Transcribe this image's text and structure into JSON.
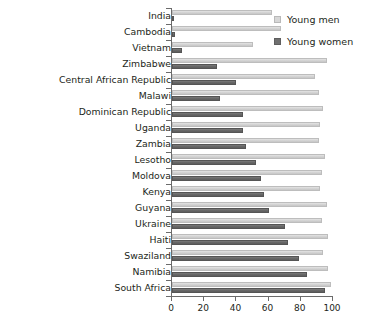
{
  "chart_data": {
    "type": "bar",
    "orientation": "horizontal",
    "title": "",
    "subtitle": "",
    "xlabel": "",
    "ylabel": "",
    "xlim": [
      0,
      100
    ],
    "xticks": [
      0,
      20,
      40,
      60,
      80,
      100
    ],
    "grid": false,
    "legend_position": "top-right",
    "categories": [
      "India",
      "Cambodia",
      "Vietnam",
      "Zimbabwe",
      "Central African Republic",
      "Malawi",
      "Dominican Republic",
      "Uganda",
      "Zambia",
      "Lesotho",
      "Moldova",
      "Kenya",
      "Guyana",
      "Ukraine",
      "Haiti",
      "Swaziland",
      "Namibia",
      "South Africa"
    ],
    "series": [
      {
        "name": "Young men",
        "color": "#d2d2d2",
        "values": [
          62,
          68,
          50,
          96,
          89,
          91,
          94,
          92,
          91,
          95,
          93,
          92,
          96,
          93,
          97,
          94,
          97,
          99
        ]
      },
      {
        "name": "Young women",
        "color": "#666666",
        "values": [
          1,
          2,
          6,
          28,
          40,
          30,
          44,
          44,
          46,
          52,
          55,
          57,
          60,
          70,
          72,
          79,
          84,
          95
        ]
      }
    ]
  },
  "legend": {
    "items": [
      {
        "label": "Young men",
        "swatch": "men"
      },
      {
        "label": "Young women",
        "swatch": "women"
      }
    ]
  }
}
